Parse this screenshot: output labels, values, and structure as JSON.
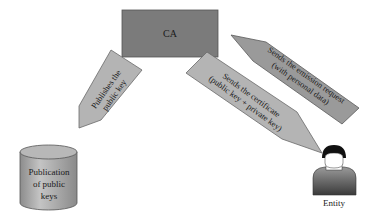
{
  "diagram": {
    "nodes": {
      "ca": {
        "label": "CA",
        "color": "#7b7b7b"
      },
      "publication": {
        "label_lines": [
          "Publication",
          "of public",
          "keys"
        ],
        "color": "#a9a9a9"
      },
      "entity": {
        "label": "Entity"
      }
    },
    "arrows": {
      "publish": {
        "label_lines": [
          "Publishes the",
          "public key"
        ],
        "color": "#b4b4b4",
        "from": "ca",
        "to": "publication"
      },
      "request": {
        "label_lines": [
          "Sends the emission request",
          "(with personal data)"
        ],
        "color": "#9a9a9a",
        "from": "entity",
        "to": "ca"
      },
      "certificate": {
        "label_lines": [
          "Sends the certificate",
          "(public key + private key)"
        ],
        "color": "#b4b4b4",
        "from": "ca",
        "to": "entity"
      }
    }
  }
}
